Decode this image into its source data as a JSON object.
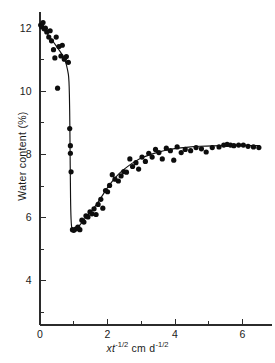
{
  "figure": {
    "background_color": "#ffffff",
    "ink_color": "#111111"
  },
  "chart_data": {
    "type": "scatter",
    "title": "",
    "subtitle": "",
    "xlabel": "xt -1/2 cm d -1/2",
    "xlabel_parts": {
      "var1": "x",
      "var2": "t",
      "exp1": "-1/2",
      "unit1": "cm",
      "var3": "d",
      "exp2": "-1/2"
    },
    "ylabel": "Water content (%)",
    "xlim": [
      0,
      6.75
    ],
    "ylim": [
      2.6,
      12.45
    ],
    "grid": false,
    "legend": null,
    "x_ticks_major": [
      0,
      2,
      4,
      6
    ],
    "x_ticks_major_labels": [
      "0",
      "2",
      "4",
      "6"
    ],
    "x_ticks_minor": [
      1,
      3,
      5
    ],
    "y_ticks_major": [
      4,
      6,
      8,
      10,
      12
    ],
    "y_ticks_major_labels": [
      "4",
      "6",
      "8",
      "10",
      "12"
    ],
    "y_ticks_minor": [
      3,
      5,
      7,
      9,
      11
    ],
    "axis_origin": {
      "x": 0,
      "y": 2.6
    },
    "series": [
      {
        "name": "measured water content",
        "marker": "filled-circle",
        "marker_size_px": 2.6,
        "color": "#0d0d0d",
        "points": [
          [
            0.02,
            12.1
          ],
          [
            0.05,
            12.05
          ],
          [
            0.09,
            12.18
          ],
          [
            0.12,
            11.98
          ],
          [
            0.16,
            12.0
          ],
          [
            0.2,
            11.88
          ],
          [
            0.26,
            11.72
          ],
          [
            0.3,
            11.92
          ],
          [
            0.34,
            11.6
          ],
          [
            0.4,
            11.32
          ],
          [
            0.44,
            11.06
          ],
          [
            0.48,
            11.72
          ],
          [
            0.52,
            10.1
          ],
          [
            0.56,
            11.42
          ],
          [
            0.62,
            11.12
          ],
          [
            0.66,
            11.46
          ],
          [
            0.72,
            11.02
          ],
          [
            0.78,
            11.1
          ],
          [
            0.84,
            10.92
          ],
          [
            0.88,
            8.82
          ],
          [
            0.9,
            8.28
          ],
          [
            0.9,
            8.04
          ],
          [
            0.92,
            7.45
          ],
          [
            0.96,
            5.62
          ],
          [
            1.0,
            5.6
          ],
          [
            1.06,
            5.64
          ],
          [
            1.12,
            5.7
          ],
          [
            1.18,
            5.62
          ],
          [
            1.24,
            5.92
          ],
          [
            1.3,
            5.86
          ],
          [
            1.36,
            6.06
          ],
          [
            1.42,
            6.02
          ],
          [
            1.48,
            6.18
          ],
          [
            1.54,
            6.12
          ],
          [
            1.6,
            6.28
          ],
          [
            1.66,
            6.1
          ],
          [
            1.72,
            6.42
          ],
          [
            1.8,
            6.58
          ],
          [
            1.86,
            6.3
          ],
          [
            1.94,
            6.86
          ],
          [
            2.0,
            6.82
          ],
          [
            2.06,
            7.02
          ],
          [
            2.14,
            7.36
          ],
          [
            2.22,
            7.22
          ],
          [
            2.32,
            7.16
          ],
          [
            2.4,
            7.32
          ],
          [
            2.48,
            7.46
          ],
          [
            2.56,
            7.44
          ],
          [
            2.66,
            7.86
          ],
          [
            2.74,
            7.62
          ],
          [
            2.84,
            7.74
          ],
          [
            2.92,
            7.54
          ],
          [
            3.02,
            7.92
          ],
          [
            3.12,
            7.78
          ],
          [
            3.22,
            8.04
          ],
          [
            3.32,
            7.92
          ],
          [
            3.42,
            8.16
          ],
          [
            3.52,
            8.06
          ],
          [
            3.62,
            7.86
          ],
          [
            3.74,
            8.2
          ],
          [
            3.86,
            8.12
          ],
          [
            3.96,
            7.82
          ],
          [
            4.06,
            8.24
          ],
          [
            4.18,
            8.06
          ],
          [
            4.3,
            8.16
          ],
          [
            4.46,
            8.12
          ],
          [
            4.62,
            8.22
          ],
          [
            4.78,
            8.18
          ],
          [
            4.92,
            8.08
          ],
          [
            5.1,
            8.22
          ],
          [
            5.3,
            8.24
          ],
          [
            5.44,
            8.3
          ],
          [
            5.54,
            8.32
          ],
          [
            5.64,
            8.3
          ],
          [
            5.74,
            8.28
          ],
          [
            5.88,
            8.3
          ],
          [
            6.02,
            8.3
          ],
          [
            6.16,
            8.26
          ],
          [
            6.32,
            8.24
          ],
          [
            6.48,
            8.22
          ]
        ]
      }
    ],
    "fitted_curve": {
      "name": "fitted profile",
      "color": "#111111",
      "points": [
        [
          0.03,
          12.08
        ],
        [
          0.2,
          11.85
        ],
        [
          0.4,
          11.56
        ],
        [
          0.6,
          11.26
        ],
        [
          0.74,
          11.02
        ],
        [
          0.82,
          10.68
        ],
        [
          0.86,
          10.4
        ],
        [
          0.88,
          9.4
        ],
        [
          0.89,
          8.2
        ],
        [
          0.9,
          7.0
        ],
        [
          0.91,
          6.2
        ],
        [
          0.93,
          5.7
        ],
        [
          0.97,
          5.58
        ],
        [
          1.05,
          5.62
        ],
        [
          1.15,
          5.72
        ],
        [
          1.28,
          5.9
        ],
        [
          1.42,
          6.08
        ],
        [
          1.56,
          6.26
        ],
        [
          1.7,
          6.46
        ],
        [
          1.86,
          6.72
        ],
        [
          2.0,
          6.96
        ],
        [
          2.16,
          7.18
        ],
        [
          2.34,
          7.4
        ],
        [
          2.52,
          7.56
        ],
        [
          2.72,
          7.72
        ],
        [
          2.94,
          7.86
        ],
        [
          3.16,
          7.96
        ],
        [
          3.4,
          8.05
        ],
        [
          3.66,
          8.12
        ],
        [
          3.94,
          8.18
        ],
        [
          4.24,
          8.22
        ],
        [
          4.56,
          8.25
        ],
        [
          4.92,
          8.27
        ],
        [
          5.3,
          8.28
        ],
        [
          5.7,
          8.29
        ],
        [
          6.1,
          8.29
        ],
        [
          6.5,
          8.28
        ]
      ]
    }
  }
}
